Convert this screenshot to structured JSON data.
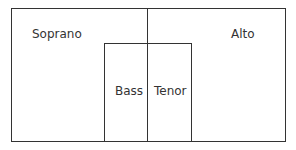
{
  "diagram": {
    "regions": [
      {
        "id": "soprano",
        "label": "Soprano"
      },
      {
        "id": "alto",
        "label": "Alto"
      },
      {
        "id": "bass",
        "label": "Bass"
      },
      {
        "id": "tenor",
        "label": "Tenor"
      }
    ],
    "line_color": "#333333"
  }
}
